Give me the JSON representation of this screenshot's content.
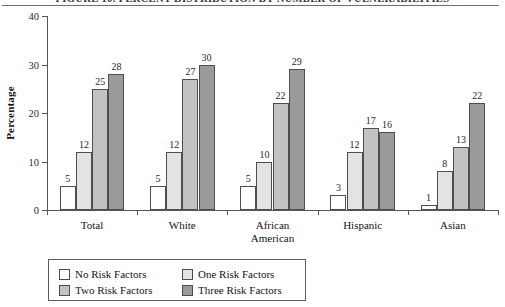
{
  "figure": {
    "title": "FIGURE 10. PERCENT DISTRIBUTION BY NUMBER OF VULNERABILITIES"
  },
  "chart_data": {
    "type": "bar",
    "title": "FIGURE 10. PERCENT DISTRIBUTION BY NUMBER OF VULNERABILITIES",
    "xlabel": "",
    "ylabel": "Percentage",
    "ylim": [
      0,
      40
    ],
    "yticks": [
      0,
      10,
      20,
      30,
      40
    ],
    "ytick_labels": [
      "0",
      "10",
      "20",
      "30",
      "40"
    ],
    "grid": false,
    "legend_position": "bottom-left",
    "categories": [
      "Total",
      "White",
      "African\nAmerican",
      "Hispanic",
      "Asian"
    ],
    "series": [
      {
        "name": "No Risk Factors",
        "color": "#ffffff",
        "values": [
          5,
          5,
          5,
          3,
          1
        ]
      },
      {
        "name": "One Risk Factors",
        "color": "#e3e3e3",
        "values": [
          12,
          12,
          10,
          12,
          8
        ]
      },
      {
        "name": "Two Risk Factors",
        "color": "#c2c2c2",
        "values": [
          25,
          27,
          22,
          17,
          13
        ]
      },
      {
        "name": "Three Risk Factors",
        "color": "#9a9a9a",
        "values": [
          28,
          30,
          29,
          16,
          22
        ]
      }
    ]
  },
  "legend": {
    "items": [
      {
        "label": "No Risk Factors"
      },
      {
        "label": "One Risk Factors"
      },
      {
        "label": "Two Risk Factors"
      },
      {
        "label": "Three Risk Factors"
      }
    ]
  }
}
